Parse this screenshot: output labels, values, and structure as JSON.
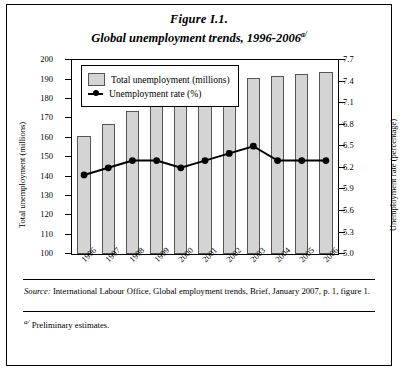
{
  "figure": {
    "label": "Figure I.1.",
    "title": "Global unemployment trends, 1996-2006",
    "title_sup": "a/",
    "source_prefix": "Source:",
    "source_text": " International Labour Office, Global employment trends, Brief, January 2007, p. 1, figure 1.",
    "footnote_sup": "a/",
    "footnote_text": " Preliminary estimates."
  },
  "legend": {
    "bars": "Total unemployment (millions)",
    "line": "Unemployment rate (%)"
  },
  "axes": {
    "left_title": "Total unemployment (millions)",
    "right_title": "Unemployment rate (percentage)",
    "left_ticks": [
      "100",
      "110",
      "120",
      "130",
      "140",
      "150",
      "160",
      "170",
      "180",
      "190",
      "200"
    ],
    "right_ticks": [
      "5.0",
      "5.3",
      "5.6",
      "5.9",
      "6.2",
      "6.5",
      "6.8",
      "7.1",
      "7.4",
      "7.7"
    ]
  },
  "chart_data": {
    "type": "bar",
    "title": "Global unemployment trends, 1996-2006",
    "xlabel": "",
    "ylabel": "Total unemployment (millions)",
    "y2label": "Unemployment rate (percentage)",
    "categories": [
      "1996",
      "1997",
      "1998",
      "1999",
      "2000",
      "2001",
      "2002",
      "2003",
      "2004",
      "2005",
      "2006"
    ],
    "ylim": [
      100,
      200
    ],
    "y2lim": [
      5.0,
      7.7
    ],
    "grid": false,
    "legend_position": "top-left",
    "series": [
      {
        "name": "Total unemployment (millions)",
        "type": "bar",
        "axis": "left",
        "color": "#d4d4d4",
        "values": [
          161,
          167,
          174,
          177,
          177,
          182,
          186,
          191,
          192,
          193,
          194
        ]
      },
      {
        "name": "Unemployment rate (%)",
        "type": "line",
        "axis": "right",
        "color": "#000000",
        "values": [
          6.1,
          6.2,
          6.3,
          6.3,
          6.2,
          6.3,
          6.4,
          6.5,
          6.3,
          6.3,
          6.3
        ]
      }
    ]
  }
}
